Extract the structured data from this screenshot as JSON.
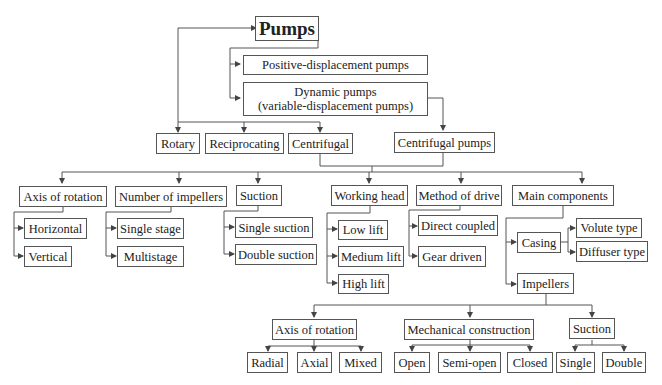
{
  "diagram": {
    "title": "Pumps",
    "level1": {
      "positive": "Positive-displacement pumps",
      "dynamic_line1": "Dynamic pumps",
      "dynamic_line2": "(variable-displacement pumps)"
    },
    "level2": {
      "rotary": "Rotary",
      "reciprocating": "Reciprocating",
      "centrifugal": "Centrifugal",
      "centrifugal_pumps": "Centrifugal pumps"
    },
    "classification": [
      {
        "label": "Axis of rotation",
        "children": [
          "Horizontal",
          "Vertical"
        ]
      },
      {
        "label": "Number of impellers",
        "children": [
          "Single stage",
          "Multistage"
        ]
      },
      {
        "label": "Suction",
        "children": [
          "Single suction",
          "Double suction"
        ]
      },
      {
        "label": "Working head",
        "children": [
          "Low lift",
          "Medium lift",
          "High lift"
        ]
      },
      {
        "label": "Method of drive",
        "children": [
          "Direct coupled",
          "Gear driven"
        ]
      },
      {
        "label": "Main components",
        "children": [
          "Casing",
          "Impellers"
        ]
      }
    ],
    "casing_types": [
      "Volute type",
      "Diffuser type"
    ],
    "impellers": [
      {
        "label": "Axis of rotation",
        "children": [
          "Radial",
          "Axial",
          "Mixed"
        ]
      },
      {
        "label": "Mechanical construction",
        "children": [
          "Open",
          "Semi-open",
          "Closed"
        ]
      },
      {
        "label": "Suction",
        "children": [
          "Single",
          "Double"
        ]
      }
    ],
    "colors": {
      "line": "#555555",
      "text": "#222222",
      "background": "#ffffff"
    }
  }
}
